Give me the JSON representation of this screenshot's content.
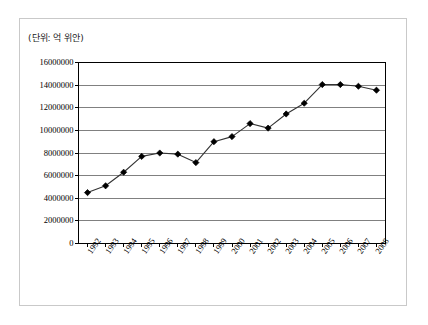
{
  "figure": {
    "unit_note": "(단위: 억 위안)"
  },
  "chart_data": {
    "type": "line",
    "title": "",
    "subtitle": "",
    "xlabel": "",
    "ylabel": "",
    "annotations": [
      "(단위: 억 위안)"
    ],
    "grid": true,
    "legend": null,
    "legend_position": "none",
    "marker": "diamond",
    "line_color": "#333333",
    "marker_color": "#000000",
    "grid_color": "#808080",
    "axis_color": "#000000",
    "ylim": [
      0,
      16000000
    ],
    "yticks": [
      0,
      2000000,
      4000000,
      6000000,
      8000000,
      10000000,
      12000000,
      14000000,
      16000000
    ],
    "ytick_labels": [
      "0",
      "2000000",
      "4000000",
      "6000000",
      "8000000",
      "10000000",
      "12000000",
      "14000000",
      "16000000"
    ],
    "categories": [
      "1992",
      "1993",
      "1994",
      "1995",
      "1996",
      "1997",
      "1998",
      "1999",
      "2000",
      "2001",
      "2002",
      "2003",
      "2004",
      "2005",
      "2006",
      "2007",
      "2008"
    ],
    "values": [
      4500000,
      5100000,
      6300000,
      7700000,
      8000000,
      7900000,
      7150000,
      9000000,
      9450000,
      10600000,
      10200000,
      11450000,
      12400000,
      14050000,
      14050000,
      13900000,
      13550000
    ]
  }
}
